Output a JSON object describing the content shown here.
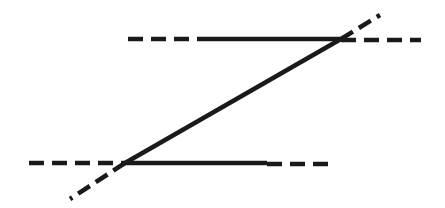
{
  "diagram": {
    "stroke_color": "#1a1a1a",
    "background": "#ffffff",
    "top_line": {
      "dashed_left": {
        "x1": 128,
        "x2": 199,
        "y": 39
      },
      "solid": {
        "x1": 199,
        "x2": 341,
        "y": 39
      },
      "dashed_right": {
        "x1": 341,
        "x2": 421,
        "y": 40
      }
    },
    "bottom_line": {
      "dashed_left": {
        "x1": 29,
        "x2": 125,
        "y": 163
      },
      "solid": {
        "x1": 125,
        "x2": 267,
        "y": 163
      },
      "dashed_right": {
        "x1": 267,
        "x2": 335,
        "y": 164
      }
    },
    "transversal": {
      "solid": {
        "x1": 125,
        "y1": 163,
        "x2": 341,
        "y2": 39
      },
      "dashed_upper": {
        "x1": 341,
        "y1": 39,
        "x2": 380,
        "y2": 15
      },
      "dashed_lower": {
        "x1": 125,
        "y1": 163,
        "x2": 70,
        "y2": 199
      }
    }
  }
}
